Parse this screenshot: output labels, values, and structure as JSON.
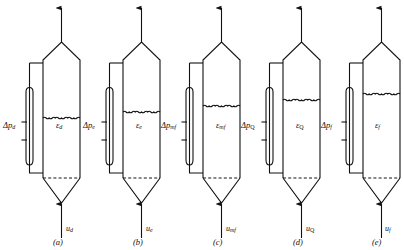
{
  "figure": {
    "type": "technical-diagram",
    "panel_count": 5,
    "stroke_color": "#111111",
    "background_color": "#ffffff"
  },
  "panels": [
    {
      "id": "a",
      "panel_label": "(a)",
      "pressure_drop_symbol": "Δp",
      "pressure_drop_subscript": "d",
      "voidage_symbol": "ε",
      "voidage_subscript": "d",
      "velocity_symbol": "u",
      "velocity_subscript": "d",
      "bed_surface_y": 118,
      "origin_x": 8
    },
    {
      "id": "b",
      "panel_label": "(b)",
      "pressure_drop_symbol": "Δp",
      "pressure_drop_subscript": "e",
      "voidage_symbol": "ε",
      "voidage_subscript": "e",
      "velocity_symbol": "u",
      "velocity_subscript": "e",
      "bed_surface_y": 112,
      "origin_x": 88
    },
    {
      "id": "c",
      "panel_label": "(c)",
      "pressure_drop_symbol": "Δp",
      "pressure_drop_subscript": "mf",
      "voidage_symbol": "ε",
      "voidage_subscript": "mf",
      "velocity_symbol": "u",
      "velocity_subscript": "mf",
      "bed_surface_y": 106,
      "origin_x": 168
    },
    {
      "id": "d",
      "panel_label": "(d)",
      "pressure_drop_symbol": "Δp",
      "pressure_drop_subscript": "Q",
      "voidage_symbol": "ε",
      "voidage_subscript": "Q",
      "velocity_symbol": "u",
      "velocity_subscript": "Q",
      "bed_surface_y": 100,
      "origin_x": 248
    },
    {
      "id": "e",
      "panel_label": "(e)",
      "pressure_drop_symbol": "Δp",
      "pressure_drop_subscript": "f",
      "voidage_symbol": "ε",
      "voidage_subscript": "f",
      "velocity_symbol": "u",
      "velocity_subscript": "f",
      "bed_surface_y": 94,
      "origin_x": 328
    }
  ]
}
